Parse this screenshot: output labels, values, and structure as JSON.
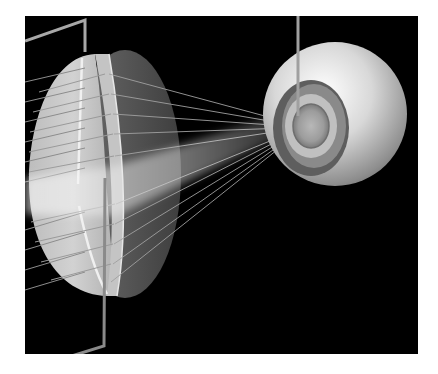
{
  "illustration": {
    "subject": "Convex lens focusing parallel light rays into an eyeball",
    "elements": {
      "lens": "biconvex lens, light front face, dark rear face",
      "rays": "parallel incoming rays converging toward the eye",
      "beam": "diffuse light beam passing through lens center",
      "eye": "eyeball sphere with pupil/iris facing the lens",
      "pointers": [
        "bracket line from top-left to lens top",
        "bracket line from lens bottom to bottom-left",
        "vertical line from top edge to pupil"
      ]
    },
    "colors": {
      "background": "#000000",
      "page": "#ffffff",
      "lens_front": "#c8c8c8",
      "lens_back": "#5a5a5a",
      "eye": "#d9d9d9",
      "lines": "#9a9a9a"
    }
  }
}
